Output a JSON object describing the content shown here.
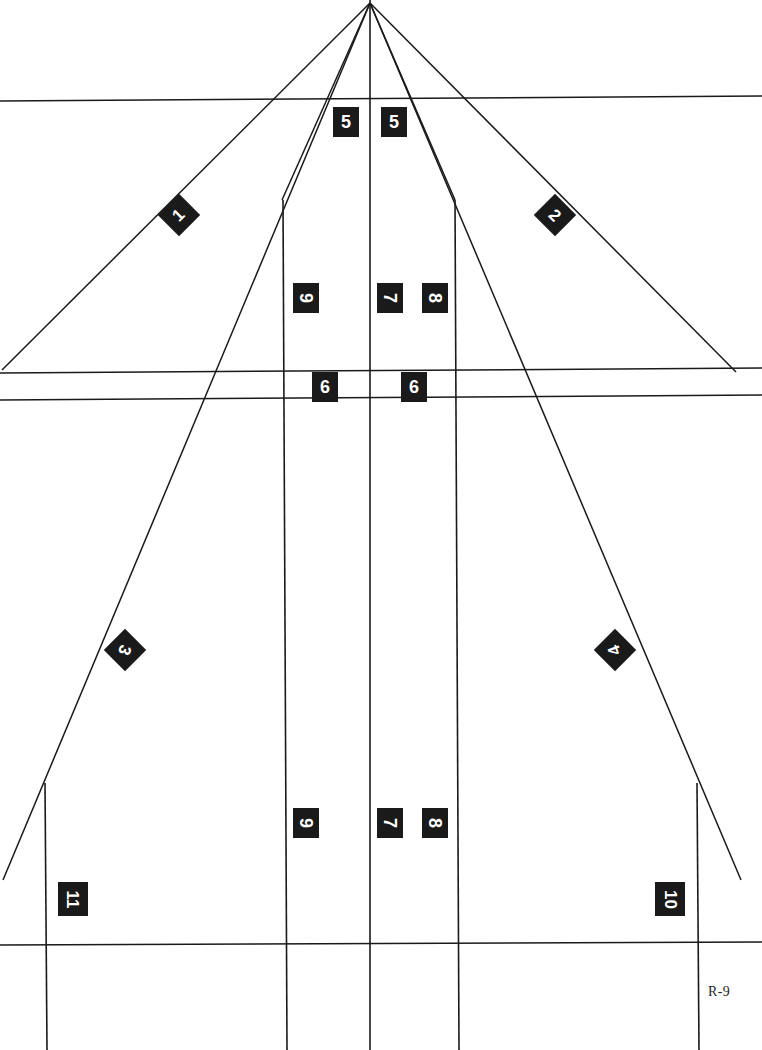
{
  "sheet": {
    "reference_label": "R-9",
    "reference_pos": {
      "x": 708,
      "y": 984
    },
    "width": 762,
    "height": 1050,
    "background_color": "#ffffff",
    "line_color": "#1a1a1a",
    "callout_fill": "#1a1a1a",
    "callout_text_color": "#ffffff"
  },
  "geometry": {
    "apex": {
      "x": 370,
      "y": 3
    },
    "rays": [
      {
        "name": "ray-left-outer",
        "x1": 370,
        "y1": 3,
        "x2": 2,
        "y2": 370
      },
      {
        "name": "ray-right-outer",
        "x1": 370,
        "y1": 3,
        "x2": 736,
        "y2": 372
      },
      {
        "name": "ray-left-long",
        "x1": 370,
        "y1": 3,
        "x2": 3,
        "y2": 880
      },
      {
        "name": "ray-right-long",
        "x1": 370,
        "y1": 3,
        "x2": 741,
        "y2": 880
      },
      {
        "name": "ray-left-inner",
        "x1": 370,
        "y1": 3,
        "x2": 282,
        "y2": 200
      },
      {
        "name": "ray-right-inner",
        "x1": 370,
        "y1": 3,
        "x2": 455,
        "y2": 200
      }
    ],
    "horizontals": [
      {
        "name": "horizon-upper",
        "x1": 0,
        "y1": 101,
        "x2": 762,
        "y2": 96
      },
      {
        "name": "datum-upper",
        "x1": 0,
        "y1": 373,
        "x2": 762,
        "y2": 368
      },
      {
        "name": "datum-lower",
        "x1": 0,
        "y1": 400,
        "x2": 762,
        "y2": 395
      },
      {
        "name": "baseline",
        "x1": 0,
        "y1": 945,
        "x2": 762,
        "y2": 942
      }
    ],
    "verticals": [
      {
        "name": "centerline",
        "x1": 370,
        "y1": 0,
        "x2": 370,
        "y2": 1050
      },
      {
        "name": "rail-left-inner",
        "x1": 283,
        "y1": 200,
        "x2": 287,
        "y2": 1050
      },
      {
        "name": "rail-right-inner",
        "x1": 455,
        "y1": 200,
        "x2": 459,
        "y2": 1050
      },
      {
        "name": "rail-left-outer",
        "x1": 45,
        "y1": 783,
        "x2": 47,
        "y2": 1050
      },
      {
        "name": "rail-right-outer",
        "x1": 697,
        "y1": 783,
        "x2": 699,
        "y2": 1050
      }
    ]
  },
  "callouts": [
    {
      "id": "c5a",
      "label": "5",
      "x": 333,
      "y": 107,
      "shape": "square",
      "rotation": 0,
      "name": "callout-5-left"
    },
    {
      "id": "c5b",
      "label": "5",
      "x": 381,
      "y": 107,
      "shape": "square",
      "rotation": 0,
      "name": "callout-5-right"
    },
    {
      "id": "c1",
      "label": "1",
      "x": 164,
      "y": 200,
      "shape": "diamond",
      "rotation": -45,
      "name": "callout-1"
    },
    {
      "id": "c2",
      "label": "2",
      "x": 540,
      "y": 200,
      "shape": "diamond",
      "rotation": 45,
      "name": "callout-2"
    },
    {
      "id": "c9a",
      "label": "9",
      "x": 293,
      "y": 283,
      "shape": "square",
      "rotation": 90,
      "name": "callout-9-upper"
    },
    {
      "id": "c7a",
      "label": "7",
      "x": 377,
      "y": 283,
      "shape": "square",
      "rotation": 90,
      "name": "callout-7-upper"
    },
    {
      "id": "c8a",
      "label": "8",
      "x": 422,
      "y": 283,
      "shape": "square",
      "rotation": 90,
      "name": "callout-8-upper"
    },
    {
      "id": "c6a",
      "label": "6",
      "x": 312,
      "y": 372,
      "shape": "square",
      "rotation": 0,
      "name": "callout-6-left"
    },
    {
      "id": "c6b",
      "label": "6",
      "x": 401,
      "y": 372,
      "shape": "square",
      "rotation": 0,
      "name": "callout-6-right"
    },
    {
      "id": "c3",
      "label": "3",
      "x": 110,
      "y": 635,
      "shape": "diamond",
      "rotation": 110,
      "name": "callout-3"
    },
    {
      "id": "c4",
      "label": "4",
      "x": 600,
      "y": 635,
      "shape": "diamond",
      "rotation": 250,
      "name": "callout-4"
    },
    {
      "id": "c9b",
      "label": "9",
      "x": 293,
      "y": 808,
      "shape": "square",
      "rotation": 90,
      "name": "callout-9-lower"
    },
    {
      "id": "c7b",
      "label": "7",
      "x": 377,
      "y": 808,
      "shape": "square",
      "rotation": 90,
      "name": "callout-7-lower"
    },
    {
      "id": "c8b",
      "label": "8",
      "x": 422,
      "y": 808,
      "shape": "square",
      "rotation": 90,
      "name": "callout-8-lower"
    },
    {
      "id": "c11",
      "label": "11",
      "x": 58,
      "y": 882,
      "shape": "square-wide",
      "rotation": 90,
      "name": "callout-11"
    },
    {
      "id": "c10",
      "label": "10",
      "x": 655,
      "y": 882,
      "shape": "square-wide",
      "rotation": 90,
      "name": "callout-10"
    }
  ]
}
